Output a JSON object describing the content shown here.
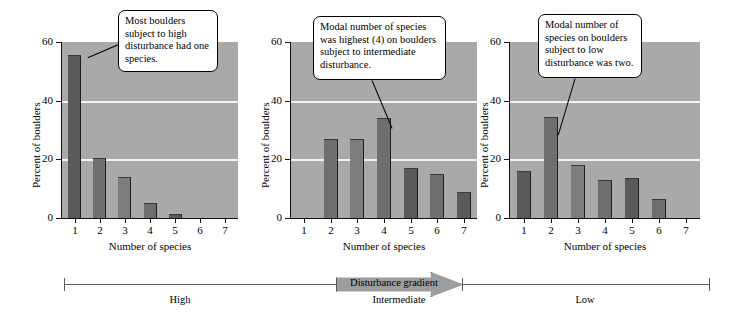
{
  "figure": {
    "axis_label_y": "Percent of boulders",
    "axis_label_x": "Number of species",
    "gradient": {
      "arrow_label": "Disturbance gradient",
      "tiers": [
        "High",
        "Intermediate",
        "Low"
      ]
    },
    "colors": {
      "plot_background": "#a9a9a9",
      "bar_fill": "#6c6c6c",
      "gridline": "#f2f2f2",
      "axis": "#111111",
      "callout_border": "#000000",
      "arrow_fill": "#9d9d9d"
    }
  },
  "chart_data": [
    {
      "type": "bar",
      "title": "High disturbance",
      "categories": [
        "1",
        "2",
        "3",
        "4",
        "5",
        "6",
        "7"
      ],
      "values": [
        55.6,
        20.5,
        14,
        5,
        1.5,
        0,
        0
      ],
      "xlabel": "Number of species",
      "ylabel": "Percent of boulders",
      "ylim": [
        0,
        60
      ],
      "yticks": [
        0,
        20,
        40,
        60
      ],
      "grid": true,
      "annotation": "Most boulders subject to high disturbance had one species."
    },
    {
      "type": "bar",
      "title": "Intermediate disturbance",
      "categories": [
        "1",
        "2",
        "3",
        "4",
        "5",
        "6",
        "7"
      ],
      "values": [
        0,
        27,
        27,
        34,
        17,
        15,
        9
      ],
      "xlabel": "Number of species",
      "ylabel": "Percent of boulders",
      "ylim": [
        0,
        60
      ],
      "yticks": [
        0,
        20,
        40,
        60
      ],
      "grid": true,
      "annotation": "Modal number of species was highest (4) on boulders subject to intermediate disturbance."
    },
    {
      "type": "bar",
      "title": "Low disturbance",
      "categories": [
        "1",
        "2",
        "3",
        "4",
        "5",
        "6",
        "7"
      ],
      "values": [
        16,
        34.5,
        18,
        13,
        13.5,
        6.5,
        0
      ],
      "xlabel": "Number of species",
      "ylabel": "Percent of boulders",
      "ylim": [
        0,
        60
      ],
      "yticks": [
        0,
        20,
        40,
        60
      ],
      "grid": true,
      "annotation": "Modal number of species on boulders subject to low disturbance was two."
    }
  ]
}
